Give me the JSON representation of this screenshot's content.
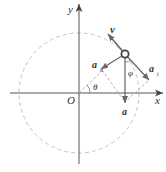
{
  "diagram": {
    "type": "circular-motion-acceleration",
    "labels": {
      "y_axis": "y",
      "x_axis": "x",
      "origin": "O",
      "velocity": "v",
      "normal_accel": "a",
      "normal_sub": "n",
      "tangential_accel": "a",
      "tangential_sub": "t",
      "total_accel": "a",
      "theta": "θ",
      "phi": "φ"
    },
    "colors": {
      "axes": "#555555",
      "circle": "#bbbbbb",
      "vectors": "#666666",
      "text": "#333333"
    }
  }
}
